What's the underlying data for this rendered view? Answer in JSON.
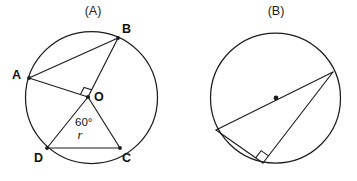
{
  "page": {
    "background_color": "#ffffff",
    "ink_color": "#1c1c1c",
    "width": 357,
    "height": 181
  },
  "figures": [
    {
      "id": "figure-a",
      "caption": "(A)",
      "caption_x": 93,
      "caption_y": 15,
      "circle": {
        "cx": 91.5,
        "cy": 97.5,
        "r": 66
      },
      "center_point": {
        "label": "O",
        "x": 88,
        "y": 97,
        "label_x": 94,
        "label_y": 101
      },
      "points": [
        {
          "name": "A",
          "x": 29,
          "y": 78,
          "label_x": 12,
          "label_y": 79
        },
        {
          "name": "B",
          "x": 118,
          "y": 38,
          "label_x": 122,
          "label_y": 33
        },
        {
          "name": "C",
          "x": 120,
          "y": 148,
          "label_x": 122,
          "label_y": 162
        },
        {
          "name": "D",
          "x": 47,
          "y": 148,
          "label_x": 34,
          "label_y": 162
        }
      ],
      "segments": [
        {
          "name": "chord-AB",
          "from": "A",
          "to": "B"
        },
        {
          "name": "radius-OA",
          "from": "O",
          "to": "A"
        },
        {
          "name": "radius-OB",
          "from": "O",
          "to": "B"
        },
        {
          "name": "radius-OD",
          "from": "O",
          "to": "D"
        },
        {
          "name": "radius-OC",
          "from": "O",
          "to": "C"
        },
        {
          "name": "chord-DC",
          "from": "D",
          "to": "C"
        }
      ],
      "right_angle_marker": {
        "at": "O",
        "between": "OA-OB",
        "x": 80,
        "y": 84,
        "size": 8
      },
      "angle_label": {
        "text": "60°",
        "at": "O",
        "between": "OD-OC",
        "x": 75,
        "y": 126
      },
      "length_label": {
        "text": "r",
        "on": "chord-DC",
        "x": 80,
        "y": 139
      }
    },
    {
      "id": "figure-b",
      "caption": "(B)",
      "caption_x": 276,
      "caption_y": 15,
      "circle": {
        "cx": 275.5,
        "cy": 98,
        "r": 65
      },
      "center_point": {
        "label": "",
        "x": 276,
        "y": 98,
        "label_x": 0,
        "label_y": 0
      },
      "points": [
        {
          "name": "P1",
          "x": 216,
          "y": 130,
          "label_x": 0,
          "label_y": 0
        },
        {
          "name": "P2",
          "x": 333,
          "y": 72,
          "label_x": 0,
          "label_y": 0
        },
        {
          "name": "P3",
          "x": 263,
          "y": 163,
          "label_x": 0,
          "label_y": 0
        }
      ],
      "segments": [
        {
          "name": "diameter-P1-P2",
          "from": "P1",
          "to": "P2"
        },
        {
          "name": "leg-P1-P3",
          "from": "P1",
          "to": "P3"
        },
        {
          "name": "leg-P3-P2",
          "from": "P3",
          "to": "P2"
        }
      ],
      "right_angle_marker": {
        "at": "P3",
        "between": "P3P1-P3P2",
        "x": 256,
        "y": 148,
        "size": 9
      },
      "angle_label": {
        "text": "",
        "at": "",
        "between": "",
        "x": 0,
        "y": 0
      },
      "length_label": {
        "text": "",
        "on": "",
        "x": 0,
        "y": 0
      }
    }
  ]
}
